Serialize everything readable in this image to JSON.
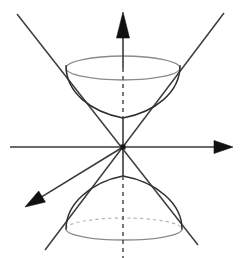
{
  "figure": {
    "title": "Two-sheeted hyperboloid with asymptotic cone",
    "background_color": "#ffffff",
    "width": 247,
    "height": 258
  },
  "colors": {
    "axis": "#3a3a3a",
    "axis_hidden": "#4a4a4a",
    "arrow": "#111111",
    "asymptote": "#3d3d3d",
    "surface_outline": "#2f2f2f",
    "rim_visible": "#8b8b8b",
    "rim_hidden": "#b4b4b4"
  },
  "chart_data": {
    "type": "line",
    "title": "Two-sheeted hyperboloid with asymptotic cone",
    "xlabel": "",
    "ylabel": "",
    "grid": false,
    "legend": false,
    "origin": {
      "x": 123,
      "y": 147
    },
    "axes": [
      {
        "name": "x-axis",
        "orientation": "horizontal",
        "from": {
          "x": 10,
          "y": 147
        },
        "to": {
          "x": 233,
          "y": 147
        },
        "arrow_at": "end",
        "style": "solid"
      },
      {
        "name": "z-axis",
        "orientation": "vertical",
        "from": {
          "x": 123,
          "y": 258
        },
        "to": {
          "x": 123,
          "y": 12
        },
        "arrow_at": "end",
        "style": "mixed-solid-dashed"
      },
      {
        "name": "y-axis",
        "orientation": "oblique-depth",
        "from": {
          "x": 123,
          "y": 147
        },
        "to": {
          "x": 25,
          "y": 207
        },
        "arrow_at": "end",
        "style": "solid"
      }
    ],
    "asymptote_lines": [
      {
        "name": "asymptote-nw-se",
        "from": {
          "x": 17,
          "y": 14
        },
        "to": {
          "x": 198,
          "y": 245
        }
      },
      {
        "name": "asymptote-ne-sw",
        "from": {
          "x": 224,
          "y": 13
        },
        "to": {
          "x": 45,
          "y": 250
        }
      }
    ],
    "sheets": [
      {
        "name": "upper-sheet",
        "vertex": {
          "x": 123,
          "y": 118
        },
        "rim_ellipse": {
          "cx": 123,
          "cy": 68,
          "rx": 57,
          "ry": 12
        },
        "rim_back_hidden": false
      },
      {
        "name": "lower-sheet",
        "vertex": {
          "x": 123,
          "y": 176
        },
        "rim_ellipse": {
          "cx": 124,
          "cy": 229,
          "rx": 58,
          "ry": 11
        },
        "rim_back_hidden": true
      }
    ],
    "hidden_axis_segments": [
      {
        "from_y": 68,
        "to_y": 116
      },
      {
        "from_y": 176,
        "to_y": 258
      }
    ],
    "annotations": []
  }
}
